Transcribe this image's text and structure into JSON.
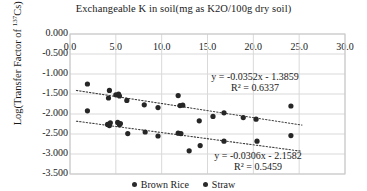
{
  "chart_data": {
    "type": "scatter",
    "title": "Exchangeable K in soil(mg as K2O/100g dry soil)",
    "xlabel": "Exchangeable K in soil(mg as K2O/100g dry soil)",
    "ylabel": "Log(Transfer Factor of 137Cs)",
    "ylabel_base": "Log(Transfer Factor of ",
    "ylabel_sup": "137",
    "ylabel_tail": "Cs)",
    "xlim": [
      0.0,
      30.0
    ],
    "ylim": [
      -3.5,
      0.0
    ],
    "grid": true,
    "x_ticks": [
      "0.0",
      "5.0",
      "10.0",
      "15.0",
      "20.0",
      "25.0",
      "30.0"
    ],
    "x_tick_values": [
      0.0,
      5.0,
      10.0,
      15.0,
      20.0,
      25.0,
      30.0
    ],
    "y_ticks": [
      "0.000",
      "-0.500",
      "-1.000",
      "-1.500",
      "-2.000",
      "-2.500",
      "-3.000",
      "-3.500"
    ],
    "y_tick_values": [
      0.0,
      -0.5,
      -1.0,
      -1.5,
      -2.0,
      -2.5,
      -3.0,
      -3.5
    ],
    "legend_position": "bottom",
    "marker_color": "#262626",
    "grid_color": "#d9d9d9",
    "trendline_color": "#404040",
    "series": [
      {
        "name": "Brown Rice",
        "marker": "circle",
        "points": [
          [
            1.9,
            -1.25
          ],
          [
            4.3,
            -1.41
          ],
          [
            4.2,
            -1.6
          ],
          [
            5.0,
            -1.52
          ],
          [
            5.3,
            -1.5
          ],
          [
            5.4,
            -1.55
          ],
          [
            6.2,
            -1.66
          ],
          [
            8.1,
            -1.77
          ],
          [
            9.6,
            -1.84
          ],
          [
            11.8,
            -1.54
          ],
          [
            12.0,
            -1.79
          ],
          [
            12.3,
            -1.78
          ],
          [
            14.1,
            -2.17
          ],
          [
            15.6,
            -2.06
          ],
          [
            16.8,
            -1.97
          ],
          [
            18.9,
            -2.09
          ],
          [
            20.3,
            -2.13
          ],
          [
            24.1,
            -1.8
          ]
        ],
        "trendline": {
          "equation": "y = -0.0352x - 1.3859",
          "r2_label": "R² = 0.6337",
          "slope": -0.0352,
          "intercept": -1.3859,
          "r2": 0.6337
        }
      },
      {
        "name": "Straw",
        "marker": "circle",
        "points": [
          [
            1.9,
            -1.92
          ],
          [
            4.1,
            -2.26
          ],
          [
            4.3,
            -2.29
          ],
          [
            4.4,
            -2.22
          ],
          [
            5.2,
            -2.21
          ],
          [
            5.4,
            -2.27
          ],
          [
            5.5,
            -2.24
          ],
          [
            6.3,
            -2.49
          ],
          [
            8.2,
            -2.45
          ],
          [
            9.6,
            -2.55
          ],
          [
            11.8,
            -2.48
          ],
          [
            12.1,
            -2.49
          ],
          [
            13.0,
            -2.92
          ],
          [
            14.2,
            -2.79
          ],
          [
            16.8,
            -2.68
          ],
          [
            20.4,
            -2.68
          ],
          [
            24.1,
            -2.54
          ]
        ],
        "trendline": {
          "equation": "y = -0.0306x - 2.1582",
          "r2_label": "R² = 0.5459",
          "slope": -0.0306,
          "intercept": -2.1582,
          "r2": 0.5459
        }
      }
    ],
    "annotations": [
      {
        "text_line1": "y = -0.0352x - 1.3859",
        "text_line2": "R² = 0.6337",
        "x_px": 255,
        "y_px": 71
      },
      {
        "text_line1": "y = -0.0306x - 2.1582",
        "text_line2": "R² = 0.5459",
        "x_px": 258,
        "y_px": 150
      }
    ]
  },
  "legend": {
    "items": [
      {
        "label": "Brown Rice"
      },
      {
        "label": "Straw"
      }
    ]
  }
}
